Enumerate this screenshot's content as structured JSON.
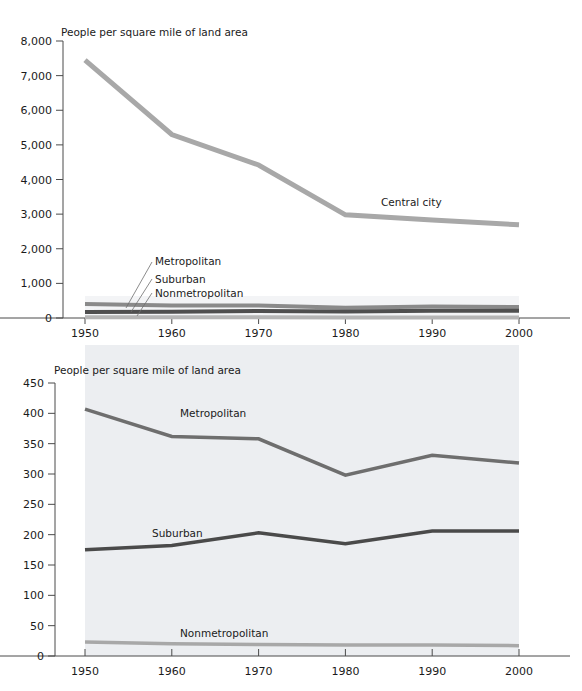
{
  "figure": {
    "background_color": "#ffffff",
    "panel_background_color": "#eceef1",
    "axis_color": "#4a4a4a"
  },
  "chart_data": [
    {
      "id": "top-chart",
      "type": "line",
      "title": "",
      "axis_title": "People per square mile of land area",
      "xlabel": "",
      "ylabel": "People per square mile of land area",
      "x": [
        1950,
        1960,
        1970,
        1980,
        1990,
        2000
      ],
      "xtick_labels": [
        "1950",
        "1960",
        "1970",
        "1980",
        "1990",
        "2000"
      ],
      "xlim": [
        1950,
        2000
      ],
      "ylim": [
        0,
        8000
      ],
      "ytick_labels": [
        "0",
        "1,000",
        "2,000",
        "3,000",
        "4,000",
        "5,000",
        "6,000",
        "7,000",
        "8,000"
      ],
      "ytick_values": [
        0,
        1000,
        2000,
        3000,
        4000,
        5000,
        6000,
        7000,
        8000
      ],
      "grid": false,
      "legend_position": "inline-annotations",
      "series": [
        {
          "name": "Central city",
          "color": "#a8a8a8",
          "width": 5,
          "values": [
            7450,
            5300,
            4420,
            2980,
            2830,
            2690
          ],
          "label": "Central city",
          "label_x": 381,
          "label_y": 206
        },
        {
          "name": "Metropolitan",
          "color": "#8a8a8a",
          "width": 4,
          "values": [
            407,
            362,
            358,
            298,
            331,
            318
          ],
          "label": "Metropolitan",
          "label_x": 155,
          "label_y": 265
        },
        {
          "name": "Suburban",
          "color": "#4f4f4f",
          "width": 4,
          "values": [
            175,
            182,
            203,
            185,
            206,
            206
          ],
          "label": "Suburban",
          "label_x": 155,
          "label_y": 283
        },
        {
          "name": "Nonmetropolitan",
          "color": "#b5b5b5",
          "width": 4,
          "values": [
            23,
            20,
            19,
            18,
            18,
            17
          ],
          "label": "Nonmetropolitan",
          "label_x": 155,
          "label_y": 297
        }
      ]
    },
    {
      "id": "bottom-chart",
      "type": "line",
      "title": "",
      "axis_title": "People per square mile of land area",
      "xlabel": "",
      "ylabel": "People per square mile of land area",
      "x": [
        1950,
        1960,
        1970,
        1980,
        1990,
        2000
      ],
      "xtick_labels": [
        "1950",
        "1960",
        "1970",
        "1980",
        "1990",
        "2000"
      ],
      "xlim": [
        1950,
        2000
      ],
      "ylim": [
        0,
        450
      ],
      "ytick_labels": [
        "0",
        "50",
        "100",
        "150",
        "200",
        "250",
        "300",
        "350",
        "400",
        "450"
      ],
      "ytick_values": [
        0,
        50,
        100,
        150,
        200,
        250,
        300,
        350,
        400,
        450
      ],
      "grid": false,
      "legend_position": "inline-annotations",
      "series": [
        {
          "name": "Metropolitan",
          "color": "#6e6e6e",
          "width": 3.5,
          "values": [
            407,
            362,
            358,
            298,
            331,
            318
          ],
          "label": "Metropolitan",
          "label_x": 180,
          "label_y": 417
        },
        {
          "name": "Suburban",
          "color": "#4a4a4a",
          "width": 3.5,
          "values": [
            175,
            182,
            203,
            185,
            206,
            206
          ],
          "label": "Suburban",
          "label_x": 152,
          "label_y": 537
        },
        {
          "name": "Nonmetropolitan",
          "color": "#a8a8a8",
          "width": 3.5,
          "values": [
            23,
            20,
            19,
            18,
            18,
            17
          ],
          "label": "Nonmetropolitan",
          "label_x": 180,
          "label_y": 637
        }
      ]
    }
  ],
  "top": {
    "axis_title": "People per square mile of land area",
    "y_ticks": [
      "8,000",
      "7,000",
      "6,000",
      "5,000",
      "4,000",
      "3,000",
      "2,000",
      "1,000",
      "0"
    ],
    "x_ticks": [
      "1950",
      "1960",
      "1970",
      "1980",
      "1990",
      "2000"
    ],
    "annotations": {
      "central_city": "Central city",
      "metropolitan": "Metropolitan",
      "suburban": "Suburban",
      "nonmetropolitan": "Nonmetropolitan"
    }
  },
  "bottom": {
    "axis_title": "People per square mile of land area",
    "y_ticks": [
      "450",
      "400",
      "350",
      "300",
      "250",
      "200",
      "150",
      "100",
      "50",
      "0"
    ],
    "x_ticks": [
      "1950",
      "1960",
      "1970",
      "1980",
      "1990",
      "2000"
    ],
    "annotations": {
      "metropolitan": "Metropolitan",
      "suburban": "Suburban",
      "nonmetropolitan": "Nonmetropolitan"
    }
  }
}
